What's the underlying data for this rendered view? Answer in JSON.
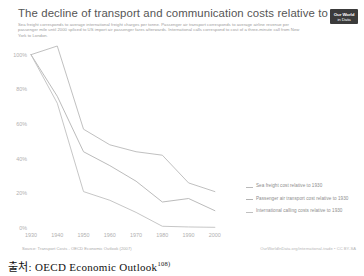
{
  "chart": {
    "title": "The decline of transport and communication costs relative to 1930",
    "subtitle": "Sea freight corresponds to average international freight charges per tonne. Passenger air transport corresponds to average airline revenue per passenger mile until 2000 spliced to US import air passenger fares afterwards. International calls correspond to cost of a three-minute call from New York to London.",
    "logo_line1": "Our World",
    "logo_line2": "in Data",
    "source_note": "Source: Transport Costs - OECD Economic Outlook (2007)",
    "attribution": "OurWorldInData.org/international-trade • CC BY-SA"
  },
  "caption": {
    "text": "출처: OECD Economic Outlook",
    "footnote": "108)"
  },
  "chart_data": {
    "type": "line",
    "title": "The decline of transport and communication costs relative to 1930",
    "xlabel": "",
    "ylabel": "",
    "xlim": [
      1930,
      2005
    ],
    "ylim": [
      0,
      105
    ],
    "grid": false,
    "legend_position": "right",
    "x": [
      1930,
      1940,
      1950,
      1960,
      1970,
      1980,
      1990,
      2000
    ],
    "xtick_labels": [
      "1930",
      "1940",
      "1950",
      "1960",
      "1970",
      "1980",
      "1990",
      "2000"
    ],
    "ytick_labels": [
      "0%",
      "20%",
      "40%",
      "60%",
      "80%",
      "100%"
    ],
    "ytick_values": [
      0,
      20,
      40,
      60,
      80,
      100
    ],
    "series": [
      {
        "name": "Sea freight cost relative to 1930",
        "color": "#b9b9b9",
        "values": [
          100,
          105,
          57,
          48,
          44,
          42,
          26,
          21
        ]
      },
      {
        "name": "Passenger air transport cost relative to 1930",
        "color": "#b3b3b3",
        "values": [
          100,
          76,
          44,
          36,
          27,
          15,
          17,
          10
        ]
      },
      {
        "name": "International calling costs relative to 1930",
        "color": "#c0c0c0",
        "values": [
          100,
          72,
          21,
          16,
          9,
          1,
          0.6,
          0.4
        ]
      }
    ]
  },
  "legend": [
    {
      "label": "Sea freight cost relative to 1930",
      "color": "#b9b9b9"
    },
    {
      "label": "Passenger air transport cost relative to 1930",
      "color": "#b3b3b3"
    },
    {
      "label": "International calling costs relative to 1930",
      "color": "#c0c0c0"
    }
  ]
}
